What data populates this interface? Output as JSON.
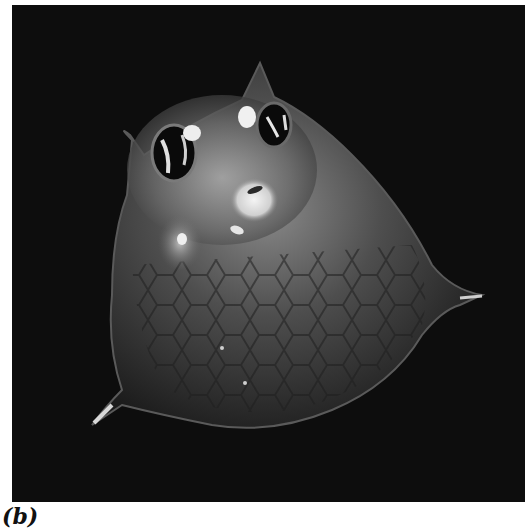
{
  "figure": {
    "label": "(b)",
    "colors": {
      "background": "#0d0d0d",
      "body": "#5a5a5a",
      "highlight": "#e8e8e8"
    }
  }
}
